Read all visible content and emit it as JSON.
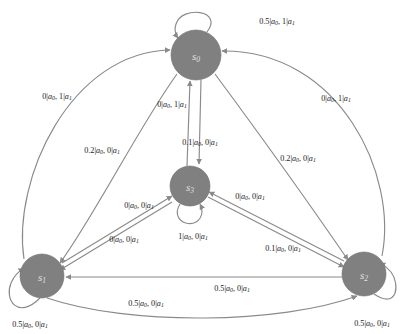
{
  "diagram": {
    "type": "state-transition-diagram",
    "title": "",
    "node_fill_color": "#808080",
    "node_text_color": "#e2e2e2",
    "edge_color": "#8a8a8a",
    "background_color": "#ffffff",
    "nodes": [
      {
        "id": "s0",
        "label": "s",
        "sub": "0",
        "cx": 196,
        "cy": 55,
        "r": 25
      },
      {
        "id": "s1",
        "label": "s",
        "sub": "1",
        "cx": 42,
        "cy": 276,
        "r": 22
      },
      {
        "id": "s2",
        "label": "s",
        "sub": "2",
        "cx": 364,
        "cy": 274,
        "r": 22
      },
      {
        "id": "s3",
        "label": "s",
        "sub": "3",
        "cx": 190,
        "cy": 186,
        "r": 20
      }
    ],
    "edges": [
      {
        "id": "s0-self",
        "from": "s0",
        "to": "s0",
        "p0": "0.5",
        "p1": "1",
        "label_x": 277,
        "label_y": 21
      },
      {
        "id": "s1-self",
        "from": "s1",
        "to": "s1",
        "p0": "0.5",
        "p1": "0",
        "label_x": 30,
        "label_y": 324
      },
      {
        "id": "s2-self",
        "from": "s2",
        "to": "s2",
        "p0": "0.5",
        "p1": "0",
        "label_x": 372,
        "label_y": 323
      },
      {
        "id": "s3-self",
        "from": "s3",
        "to": "s3",
        "p0": "1",
        "p1": "0",
        "label_x": 193,
        "label_y": 236
      },
      {
        "id": "s1-s0",
        "from": "s1",
        "to": "s0",
        "p0": "0",
        "p1": "1",
        "label_x": 57,
        "label_y": 96
      },
      {
        "id": "s0-s1",
        "from": "s0",
        "to": "s1",
        "p0": "0.2",
        "p1": "0",
        "label_x": 102,
        "label_y": 150
      },
      {
        "id": "s2-s0",
        "from": "s2",
        "to": "s0",
        "p0": "0",
        "p1": "1",
        "label_x": 336,
        "label_y": 98
      },
      {
        "id": "s0-s2",
        "from": "s0",
        "to": "s2",
        "p0": "0.2",
        "p1": "0",
        "label_x": 298,
        "label_y": 158
      },
      {
        "id": "s3-s0",
        "from": "s3",
        "to": "s0",
        "p0": "0",
        "p1": "1",
        "label_x": 172,
        "label_y": 104
      },
      {
        "id": "s0-s3",
        "from": "s0",
        "to": "s3",
        "p0": "0.1",
        "p1": "0",
        "label_x": 200,
        "label_y": 142
      },
      {
        "id": "s1-s3",
        "from": "s1",
        "to": "s3",
        "p0": "0",
        "p1": "0",
        "label_x": 139,
        "label_y": 205
      },
      {
        "id": "s3-s1",
        "from": "s3",
        "to": "s1",
        "p0": "0",
        "p1": "0",
        "label_x": 124,
        "label_y": 239
      },
      {
        "id": "s2-s3",
        "from": "s2",
        "to": "s3",
        "p0": "0",
        "p1": "0",
        "label_x": 250,
        "label_y": 196
      },
      {
        "id": "s3-s2",
        "from": "s3",
        "to": "s2",
        "p0": "0.1",
        "p1": "0",
        "label_x": 283,
        "label_y": 248
      },
      {
        "id": "s2-s1",
        "from": "s2",
        "to": "s1",
        "p0": "0.5",
        "p1": "0",
        "label_x": 232,
        "label_y": 288
      },
      {
        "id": "s1-s2",
        "from": "s1",
        "to": "s2",
        "p0": "0.5",
        "p1": "0",
        "label_x": 146,
        "label_y": 303
      }
    ],
    "action_symbols": {
      "a0": "a",
      "a0_sub": "0",
      "a1": "a",
      "a1_sub": "1",
      "separator": "|",
      "joiner": ", "
    }
  }
}
